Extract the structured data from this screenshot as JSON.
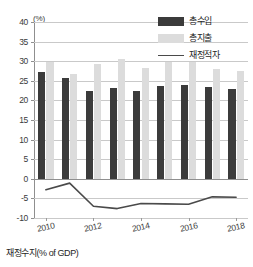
{
  "chart_data": {
    "type": "bar",
    "title": "",
    "subtitle": "",
    "xlabel": "",
    "ylabel": "",
    "unit_label": "(%)",
    "ylim": [
      -10,
      40
    ],
    "ytick_labels": [
      "40",
      "35",
      "30",
      "25",
      "20",
      "15",
      "10",
      "5",
      "0",
      "-5",
      "-10"
    ],
    "ytick_values": [
      40,
      35,
      30,
      25,
      20,
      15,
      10,
      5,
      0,
      -5,
      -10
    ],
    "grid": true,
    "legend_position": "top-right",
    "categories": [
      "2010",
      "2011",
      "2012",
      "2013",
      "2014",
      "2015",
      "2016",
      "2017",
      "2018"
    ],
    "xtick_labels": [
      "2010",
      "2012",
      "2014",
      "2016",
      "2018"
    ],
    "series": [
      {
        "name": "종수입",
        "type": "bar",
        "color": "#3b3b3b",
        "values": [
          27.2,
          25.8,
          22.5,
          23.1,
          22.3,
          23.8,
          23.9,
          23.4,
          22.9
        ]
      },
      {
        "name": "총지출",
        "type": "bar",
        "color": "#dcdcdc",
        "values": [
          29.9,
          26.8,
          29.2,
          30.5,
          28.3,
          29.9,
          29.9,
          28.0,
          27.4
        ]
      },
      {
        "name": "재정적자",
        "type": "line",
        "color": "#4a4a4a",
        "values": [
          -2.8,
          -1.1,
          -7.0,
          -7.6,
          -6.3,
          -6.4,
          -6.5,
          -4.6,
          -4.7
        ]
      }
    ]
  },
  "legend": {
    "items": [
      {
        "label": "총수입",
        "style": "square-dark"
      },
      {
        "label": "총지출",
        "style": "square-light"
      },
      {
        "label": "재정적자",
        "style": "line"
      }
    ]
  },
  "caption": {
    "text": "재정수지(% of GDP)"
  },
  "colors": {
    "revenue": "#3b3b3b",
    "expenditure": "#dcdcdc",
    "deficit_line": "#4a4a4a",
    "grid": "#c9c9c9",
    "axis": "#8f8f8f",
    "background": "#ffffff"
  }
}
